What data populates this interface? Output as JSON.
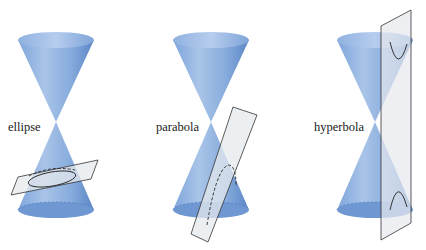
{
  "figure": {
    "panels": [
      {
        "id": "ellipse",
        "label": "ellipse"
      },
      {
        "id": "parabola",
        "label": "parabola"
      },
      {
        "id": "hyperbola",
        "label": "hyperbola"
      }
    ],
    "colors": {
      "cone_light": "#a9c4e8",
      "cone_mid": "#7fa6db",
      "cone_dark": "#5b86c6",
      "plane_fill": "#e6e9ee",
      "outline": "#2b2b2b"
    }
  }
}
